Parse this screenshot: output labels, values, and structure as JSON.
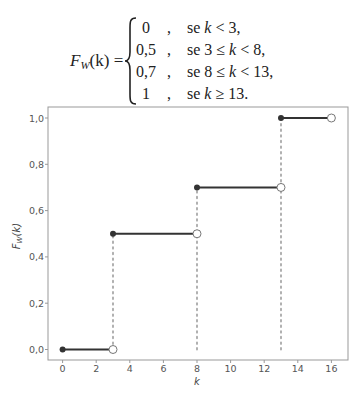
{
  "formula": {
    "lhs_func": "F",
    "lhs_sub": "W",
    "lhs_arg": "(k) =",
    "cases": [
      {
        "value": "0",
        "comma": ",",
        "cond_prefix": "se ",
        "cond_var": "k",
        "cond_suffix": " < 3,"
      },
      {
        "value": "0,5",
        "comma": ",",
        "cond_prefix": "se 3 ≤ ",
        "cond_var": "k",
        "cond_suffix": " < 8,"
      },
      {
        "value": "0,7",
        "comma": ",",
        "cond_prefix": "se 8 ≤ ",
        "cond_var": "k",
        "cond_suffix": " < 13,"
      },
      {
        "value": "1",
        "comma": ",",
        "cond_prefix": "se ",
        "cond_var": "k",
        "cond_suffix": " ≥ 13."
      }
    ]
  },
  "chart_data": {
    "type": "line",
    "subtype": "step (cumulative distribution function)",
    "title": "",
    "xlabel": "k",
    "ylabel": "F_W(k)",
    "xlim": [
      -0.8,
      17
    ],
    "ylim": [
      -0.045,
      1.05
    ],
    "xticks": [
      0,
      2,
      4,
      6,
      8,
      10,
      12,
      14,
      16
    ],
    "xtick_labels": [
      "0",
      "2",
      "4",
      "6",
      "8",
      "10",
      "12",
      "14",
      "16"
    ],
    "yticks": [
      0.0,
      0.2,
      0.4,
      0.6,
      0.8,
      1.0
    ],
    "ytick_labels": [
      "0,0",
      "0,2",
      "0,4",
      "0,6",
      "0,8",
      "1,0"
    ],
    "grid": false,
    "legend": null,
    "segments": [
      {
        "x_start": 0,
        "x_end": 3,
        "y": 0.0,
        "start": "closed",
        "end": "open"
      },
      {
        "x_start": 3,
        "x_end": 8,
        "y": 0.5,
        "start": "closed",
        "end": "open"
      },
      {
        "x_start": 8,
        "x_end": 13,
        "y": 0.7,
        "start": "closed",
        "end": "open"
      },
      {
        "x_start": 13,
        "x_end": 16,
        "y": 1.0,
        "start": "closed",
        "end": "open"
      }
    ],
    "jumps": [
      {
        "x": 3,
        "from": 0.0,
        "to": 0.5,
        "style": "dotted"
      },
      {
        "x": 8,
        "from": 0.0,
        "to": 0.7,
        "style": "dotted"
      },
      {
        "x": 13,
        "from": 0.0,
        "to": 1.0,
        "style": "dotted"
      }
    ],
    "colors": {
      "line": "#333333",
      "dotted": "#a8a8a8",
      "frame": "#999999"
    }
  }
}
